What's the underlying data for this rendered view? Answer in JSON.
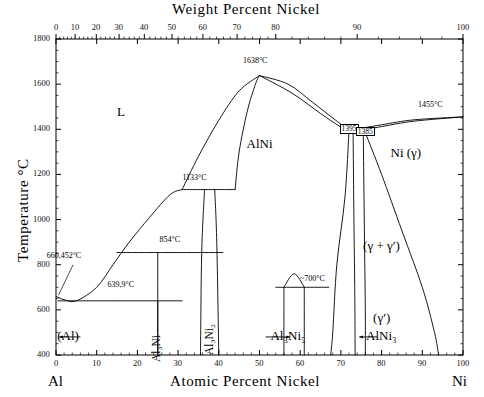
{
  "figure": {
    "top_axis_title": "Weight Percent Nickel",
    "bottom_axis_title": "Atomic Percent Nickel",
    "left_axis_title": "Temperature °C",
    "left_end_element": "Al",
    "right_end_element": "Ni"
  },
  "chart_data": {
    "type": "line",
    "xlabel": "Atomic Percent Nickel",
    "ylabel": "Temperature °C",
    "x2label": "Weight Percent Nickel",
    "xlim": [
      0,
      100
    ],
    "ylim": [
      400,
      1800
    ],
    "grid": false,
    "legend": "none",
    "xticks": [
      0,
      10,
      20,
      30,
      40,
      50,
      60,
      70,
      80,
      90,
      100
    ],
    "xticklabels": [
      "0",
      "10",
      "20",
      "30",
      "40",
      "50",
      "60",
      "70",
      "80",
      "90",
      "100"
    ],
    "yticks": [
      400,
      600,
      800,
      1000,
      1200,
      1400,
      1600,
      1800
    ],
    "yticklabels": [
      "400",
      "600",
      "800",
      "1000",
      "1200",
      "1400",
      "1600",
      "1800"
    ],
    "x2ticks_weightpct": [
      0,
      10,
      20,
      30,
      40,
      50,
      60,
      70,
      80,
      90,
      100
    ],
    "x2ticklabels": [
      "0",
      "10",
      "20",
      "30",
      "40",
      "50",
      "60",
      "70",
      "80",
      "90",
      "100"
    ],
    "x2tick_atomic_positions": [
      0.0,
      4.7,
      9.9,
      15.5,
      21.7,
      28.5,
      36.1,
      44.5,
      54.0,
      74.0,
      100.0
    ],
    "phase_regions": [
      {
        "name": "L",
        "label": "L",
        "x_atomic": 16,
        "y_temp": 1470
      },
      {
        "name": "AlNi",
        "label": "AlNi",
        "x_atomic": 50,
        "y_temp": 1330
      },
      {
        "name": "Ni-gamma",
        "label": "Ni (γ)",
        "x_atomic": 86,
        "y_temp": 1290
      },
      {
        "name": "gamma-plus-gamma-prime",
        "label": "(γ + γ′)",
        "x_atomic": 80,
        "y_temp": 880
      },
      {
        "name": "gamma-prime",
        "label": "(γ′)",
        "x_atomic": 80,
        "y_temp": 560
      },
      {
        "name": "Al-solid-solution",
        "label": "(Al)",
        "x_atomic": 3,
        "y_temp": 480
      },
      {
        "name": "Al3Ni",
        "label": "Al₃Ni",
        "x_atomic": 25,
        "y_temp": 530
      },
      {
        "name": "Al3Ni2",
        "label": "Al₃Ni₂",
        "x_atomic": 38,
        "y_temp": 560
      },
      {
        "name": "Al3Ni5",
        "label": "Al₃Ni₅",
        "x_atomic": 57,
        "y_temp": 480
      },
      {
        "name": "AlNi3",
        "label": "AlNi₃",
        "x_atomic": 80,
        "y_temp": 480
      }
    ],
    "invariant_annotations": [
      {
        "label": "660,452°C",
        "x_atomic": 2,
        "y_temp": 830,
        "note": "Al melting point"
      },
      {
        "label": "639,9°C",
        "x_atomic": 16,
        "y_temp": 700,
        "note": "Al-Al3Ni eutectic"
      },
      {
        "label": "854°C",
        "x_atomic": 28,
        "y_temp": 900,
        "note": "Al3Ni peritectic"
      },
      {
        "label": "1133°C",
        "x_atomic": 34,
        "y_temp": 1175,
        "note": "Al3Ni2 peritectic"
      },
      {
        "label": "1638°C",
        "x_atomic": 49,
        "y_temp": 1695,
        "note": "AlNi congruent melting"
      },
      {
        "label": "1455°C",
        "x_atomic": 92,
        "y_temp": 1500,
        "note": "Ni melting point"
      },
      {
        "label": "1395",
        "x_atomic": 72,
        "y_temp": 1395,
        "boxed": true
      },
      {
        "label": "1385",
        "x_atomic": 76,
        "y_temp": 1385,
        "boxed": true
      },
      {
        "label": "~700°C",
        "x_atomic": 63,
        "y_temp": 730,
        "note": "Al3Ni5 / AlNi3 region"
      }
    ],
    "boundaries": [
      {
        "name": "liquidus-Al-side",
        "points": [
          [
            0,
            660
          ],
          [
            2,
            645
          ],
          [
            5,
            640
          ],
          [
            10,
            700
          ],
          [
            14,
            800
          ],
          [
            18,
            900
          ],
          [
            23,
            1010
          ],
          [
            28,
            1110
          ],
          [
            31,
            1133
          ]
        ]
      },
      {
        "name": "eutectic-639.9",
        "points": [
          [
            0.5,
            640
          ],
          [
            31,
            640
          ]
        ]
      },
      {
        "name": "peritectic-854",
        "points": [
          [
            15,
            854
          ],
          [
            41,
            854
          ]
        ]
      },
      {
        "name": "peritectic-1133",
        "points": [
          [
            31,
            1133
          ],
          [
            44,
            1133
          ]
        ]
      },
      {
        "name": "AlNi-liquidus-left",
        "points": [
          [
            31,
            1133
          ],
          [
            35,
            1280
          ],
          [
            40,
            1440
          ],
          [
            45,
            1570
          ],
          [
            50,
            1638
          ]
        ]
      },
      {
        "name": "AlNi-liquidus-right",
        "points": [
          [
            50,
            1638
          ],
          [
            57,
            1600
          ],
          [
            63,
            1520
          ],
          [
            68,
            1450
          ],
          [
            72,
            1395
          ]
        ]
      },
      {
        "name": "AlNi-solidus-left",
        "points": [
          [
            44,
            1133
          ],
          [
            45,
            1300
          ],
          [
            47,
            1480
          ],
          [
            49,
            1600
          ],
          [
            50,
            1638
          ]
        ]
      },
      {
        "name": "AlNi-solvus-right",
        "points": [
          [
            50,
            1638
          ],
          [
            58,
            1560
          ],
          [
            65,
            1470
          ],
          [
            70,
            1410
          ],
          [
            72,
            1395
          ]
        ]
      },
      {
        "name": "Ni-liquidus-right",
        "points": [
          [
            72,
            1395
          ],
          [
            80,
            1420
          ],
          [
            88,
            1442
          ],
          [
            100,
            1455
          ]
        ]
      },
      {
        "name": "Ni-solidus-right",
        "points": [
          [
            72,
            1385
          ],
          [
            80,
            1412
          ],
          [
            88,
            1436
          ],
          [
            100,
            1455
          ]
        ]
      },
      {
        "name": "AlNi-right-phase-bound",
        "points": [
          [
            72,
            1395
          ],
          [
            71,
            1100
          ],
          [
            69,
            800
          ],
          [
            68,
            500
          ],
          [
            67.5,
            400
          ]
        ]
      },
      {
        "name": "AlNi3-left-bound",
        "points": [
          [
            73,
            1385
          ],
          [
            73.2,
            1000
          ],
          [
            73.4,
            700
          ],
          [
            73.5,
            400
          ]
        ]
      },
      {
        "name": "AlNi3-right-bound",
        "points": [
          [
            75.5,
            1385
          ],
          [
            75.8,
            900
          ],
          [
            76,
            600
          ],
          [
            76,
            400
          ]
        ]
      },
      {
        "name": "gamma-prime-solvus",
        "points": [
          [
            76,
            1385
          ],
          [
            80,
            1200
          ],
          [
            85,
            950
          ],
          [
            90,
            700
          ],
          [
            93,
            500
          ],
          [
            94,
            400
          ]
        ]
      },
      {
        "name": "Al3Ni-left",
        "points": [
          [
            25,
            640
          ],
          [
            25,
            400
          ]
        ]
      },
      {
        "name": "Al3Ni-right",
        "points": [
          [
            25,
            854
          ],
          [
            25,
            400
          ]
        ]
      },
      {
        "name": "Al3Ni2-left",
        "points": [
          [
            36.5,
            1133
          ],
          [
            35.8,
            854
          ],
          [
            35.5,
            400
          ]
        ]
      },
      {
        "name": "Al3Ni2-right",
        "points": [
          [
            39,
            1133
          ],
          [
            39.5,
            900
          ],
          [
            40,
            400
          ]
        ]
      },
      {
        "name": "Al3Ni5-left",
        "points": [
          [
            56,
            700
          ],
          [
            56,
            400
          ]
        ]
      },
      {
        "name": "Al3Ni5-right",
        "points": [
          [
            61,
            700
          ],
          [
            61,
            400
          ]
        ]
      },
      {
        "name": "Al3Ni5-peak",
        "points": [
          [
            56,
            700
          ],
          [
            58.5,
            760
          ],
          [
            61,
            700
          ]
        ]
      },
      {
        "name": "700C-line",
        "points": [
          [
            54,
            700
          ],
          [
            67,
            700
          ]
        ]
      }
    ]
  }
}
